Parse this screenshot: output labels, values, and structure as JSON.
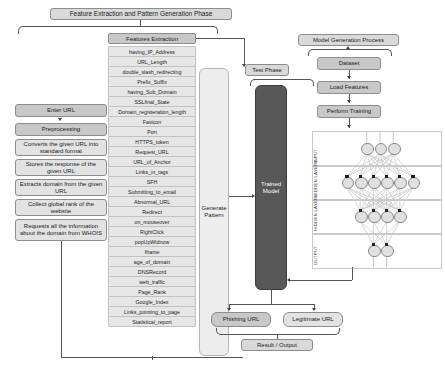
{
  "phases": {
    "feature_phase_banner": "Feature Extraction and Pattern Generation Phase",
    "test_phase": "Test Phase",
    "model_generation": "Model Generation Process"
  },
  "preprocessing_flow": {
    "enter_url": "Enter URL",
    "preprocessing": "Preprocessing",
    "steps": [
      "Converts the given URL into standard format",
      "Stores the response of the given URL",
      "Extracts domain from the given URL",
      "Collect global rank of the website",
      "Requests all the information about the domain from WHOIS"
    ]
  },
  "features": {
    "header": "Features Extraction",
    "items": [
      "having_IP_Address",
      "URL_Length",
      "double_slash_redirecting",
      "Prefix_Suffix",
      "having_Sub_Domain",
      "SSLfinal_State",
      "Domain_registeration_length",
      "Favicon",
      "Port",
      "HTTPS_token",
      "Request_URL",
      "URL_of_Anchor",
      "Links_in_tags",
      "SFH",
      "Submitting_to_email",
      "Abnormal_URL",
      "Redirect",
      "on_mouseover",
      "RightClick",
      "popUpWidnow",
      "Iframe",
      "age_of_domain",
      "DNSRecord",
      "web_traffic",
      "Page_Rank",
      "Google_Index",
      "Links_pointing_to_page",
      "Statistical_report"
    ]
  },
  "pipeline": {
    "generate_pattern": "Generate Pattern",
    "trained_model": "Trained Model"
  },
  "model_generation": {
    "dataset": "Dataset",
    "load_features": "Load Features",
    "perform_training": "Perform Training"
  },
  "neural_network": {
    "layer_labels": [
      "INPUT",
      "HIDDEN LAYER1",
      "HIDDEN LAYER2",
      "OUTPUT"
    ],
    "layer_sizes": [
      3,
      6,
      4,
      2
    ]
  },
  "outputs": {
    "phishing": "Phishing URL",
    "legitimate": "Legitimate URL",
    "result": "Result / Output"
  },
  "colors": {
    "box_grey": "#c8c8c8",
    "feature_grey": "#e6e6e6",
    "model_dark": "#585858",
    "line": "#555555"
  }
}
